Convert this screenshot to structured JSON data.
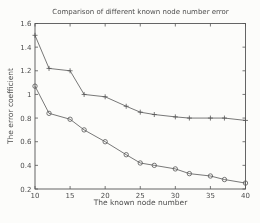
{
  "chart_data": {
    "type": "line",
    "title": "Comparison of different known node number error",
    "xlabel": "The known node number",
    "ylabel": "The error coefficient",
    "xlim": [
      10,
      40
    ],
    "ylim": [
      0.2,
      1.6
    ],
    "xticks": [
      10,
      15,
      20,
      25,
      30,
      35,
      40
    ],
    "yticks": [
      0.2,
      0.4,
      0.6,
      0.8,
      1,
      1.2,
      1.4,
      1.6
    ],
    "ytick_labels": [
      "0.2",
      "0.4",
      "0.6",
      "0.8",
      "1",
      "1.2",
      "1.4",
      "1.6"
    ],
    "grid": false,
    "legend": "none",
    "x": [
      10,
      12,
      15,
      17,
      20,
      23,
      25,
      27,
      30,
      32,
      35,
      37,
      40
    ],
    "series": [
      {
        "name": "error-curve-plus-markers",
        "marker": "plus",
        "values": [
          1.5,
          1.22,
          1.2,
          1.0,
          0.98,
          0.9,
          0.85,
          0.83,
          0.81,
          0.8,
          0.8,
          0.8,
          0.78
        ]
      },
      {
        "name": "error-curve-circle-markers",
        "marker": "circle",
        "values": [
          1.07,
          0.84,
          0.79,
          0.7,
          0.6,
          0.49,
          0.42,
          0.4,
          0.37,
          0.33,
          0.31,
          0.28,
          0.25
        ]
      }
    ],
    "colors": {
      "line": "#555555",
      "text": "#4d4d4d",
      "background": "#fcfcfa"
    }
  }
}
